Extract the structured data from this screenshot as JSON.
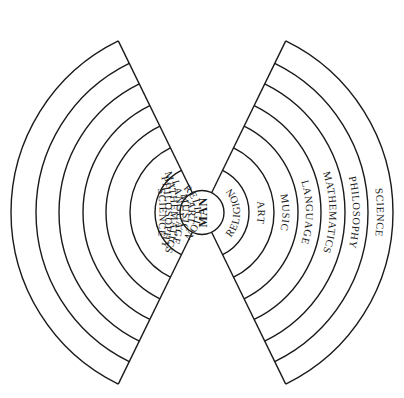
{
  "diagram": {
    "center_label": "MAN",
    "layers": [
      {
        "name": "RELIGION"
      },
      {
        "name": "ART"
      },
      {
        "name": "MUSIC"
      },
      {
        "name": "LANGUAGE"
      },
      {
        "name": "MATHEMATICS"
      },
      {
        "name": "PHILOSOPHY"
      },
      {
        "name": "SCIENCE"
      }
    ],
    "left_wedge": [
      "RELIGION",
      "ART",
      "MUSIC",
      "LANGUAGE",
      "MATHEMATICS",
      "PHILOSOPHY",
      "SCIENCE"
    ],
    "right_wedge": [
      "RELIGION",
      "ART",
      "MUSIC",
      "LANGUAGE",
      "MATHEMATICS",
      "PHILOSOPHY",
      "SCIENCE"
    ],
    "colors": {
      "stroke": "#1a1a1a",
      "background": "#ffffff"
    }
  }
}
